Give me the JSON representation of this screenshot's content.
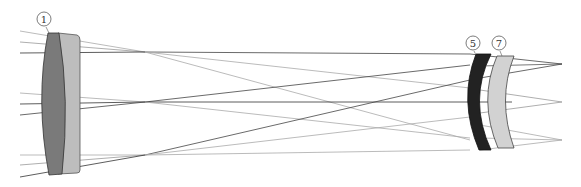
{
  "diagram": {
    "type": "optical-lens-ray-diagram",
    "labels": [
      {
        "id": "1",
        "text": "1",
        "cx": 44,
        "cy": 19
      },
      {
        "id": "5",
        "text": "5",
        "cx": 473,
        "cy": 43
      },
      {
        "id": "7",
        "text": "7",
        "cx": 499,
        "cy": 43
      }
    ],
    "colors": {
      "lens1_front": "#7a7a7a",
      "lens1_back": "#bdbdbd",
      "lens5": "#222222",
      "lens7": "#d2d2d2",
      "ray_dark": "#333333",
      "ray_light": "#a8a8a8"
    }
  }
}
